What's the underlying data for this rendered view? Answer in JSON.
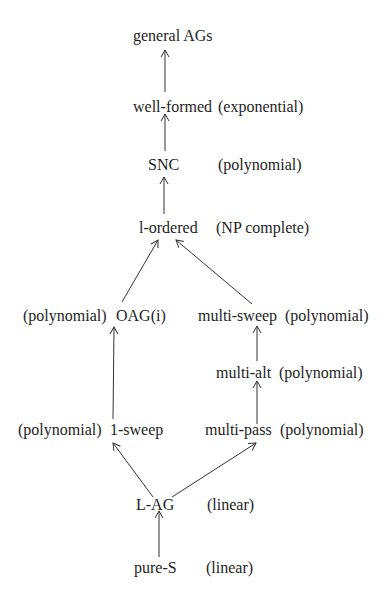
{
  "diagram": {
    "nodes": [
      {
        "id": "general",
        "label": "general AGs",
        "complexity": ""
      },
      {
        "id": "wellformed",
        "label": "well-formed",
        "complexity": "(exponential)"
      },
      {
        "id": "snc",
        "label": "SNC",
        "complexity": "(polynomial)"
      },
      {
        "id": "lordered",
        "label": "l-ordered",
        "complexity": "(NP complete)"
      },
      {
        "id": "oag",
        "label": "OAG(i)",
        "complexity": "(polynomial)"
      },
      {
        "id": "multisweep",
        "label": "multi-sweep",
        "complexity": "(polynomial)"
      },
      {
        "id": "multialt",
        "label": "multi-alt",
        "complexity": "(polynomial)"
      },
      {
        "id": "onesweep",
        "label": "1-sweep",
        "complexity": "(polynomial)"
      },
      {
        "id": "multipass",
        "label": "multi-pass",
        "complexity": "(polynomial)"
      },
      {
        "id": "lag",
        "label": "L-AG",
        "complexity": "(linear)"
      },
      {
        "id": "pures",
        "label": "pure-S",
        "complexity": "(linear)"
      }
    ],
    "edges": [
      {
        "from": "wellformed",
        "to": "general"
      },
      {
        "from": "snc",
        "to": "wellformed"
      },
      {
        "from": "lordered",
        "to": "snc"
      },
      {
        "from": "oag",
        "to": "lordered"
      },
      {
        "from": "multisweep",
        "to": "lordered"
      },
      {
        "from": "onesweep",
        "to": "oag"
      },
      {
        "from": "multialt",
        "to": "multisweep"
      },
      {
        "from": "multipass",
        "to": "multialt"
      },
      {
        "from": "lag",
        "to": "onesweep"
      },
      {
        "from": "lag",
        "to": "multipass"
      },
      {
        "from": "pures",
        "to": "lag"
      }
    ],
    "colors": {
      "line": "#333333",
      "text": "#1e1e1e",
      "background": "#ffffff"
    }
  }
}
